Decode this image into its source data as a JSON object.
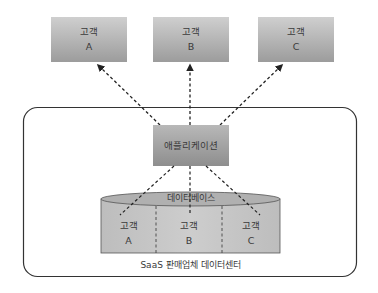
{
  "customers": [
    {
      "line1": "고객",
      "line2": "A"
    },
    {
      "line1": "고객",
      "line2": "B"
    },
    {
      "line1": "고객",
      "line2": "C"
    }
  ],
  "application": {
    "label": "애플리케이션"
  },
  "database": {
    "label": "데이터베이스",
    "partitions": [
      {
        "line1": "고객",
        "line2": "A"
      },
      {
        "line1": "고객",
        "line2": "B"
      },
      {
        "line1": "고객",
        "line2": "C"
      }
    ]
  },
  "datacenter": {
    "label": "SaaS 판매업체 데이터센터"
  },
  "colors": {
    "box_top": "#c9c9c9",
    "box_bottom": "#9a9a9a",
    "cylinder_body": "#c4c4c4",
    "cylinder_top": "#b3b3b3",
    "line": "#333333"
  }
}
